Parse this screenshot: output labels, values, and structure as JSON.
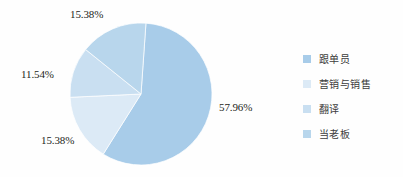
{
  "chart_data": {
    "type": "pie",
    "title": "",
    "subtitle": "",
    "xlabel": "",
    "ylabel": "",
    "legend_position": "right",
    "grid": false,
    "categories": [
      "跟单员",
      "营销与销售",
      "翻译",
      "当老板"
    ],
    "values": [
      57.96,
      15.38,
      11.54,
      15.38
    ],
    "value_labels": [
      "57.96%",
      "15.38%",
      "11.54%",
      "15.38%"
    ],
    "colors": [
      "#a8cce9",
      "#dceaf6",
      "#c9dff1",
      "#b8d6ec"
    ],
    "slices": [
      {
        "label": "跟单员",
        "value": 57.96,
        "value_label": "57.96%",
        "color": "#a8cce9"
      },
      {
        "label": "营销与销售",
        "value": 15.38,
        "value_label": "15.38%",
        "color": "#dceaf6"
      },
      {
        "label": "翻译",
        "value": 11.54,
        "value_label": "11.54%",
        "color": "#c9dff1"
      },
      {
        "label": "当老板",
        "value": 15.38,
        "value_label": "15.38%",
        "color": "#b8d6ec"
      }
    ]
  },
  "legend": {
    "items": [
      {
        "label": "跟单员",
        "color": "#a8cce9"
      },
      {
        "label": "营销与销售",
        "color": "#dceaf6"
      },
      {
        "label": "翻译",
        "color": "#c9dff1"
      },
      {
        "label": "当老板",
        "color": "#b8d6ec"
      }
    ]
  },
  "labels": {
    "right": "57.96%",
    "bottom_left": "15.38%",
    "left": "11.54%",
    "top": "15.38%"
  }
}
